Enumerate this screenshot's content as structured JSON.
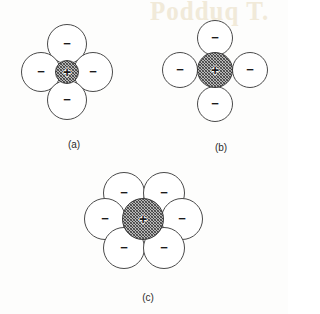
{
  "figure": {
    "background_color": "#fdfdfc",
    "line_color": "#4a4a4a",
    "cation_fill": "#b9b9b9",
    "anion_fill": "#ffffff",
    "bleed_through_text": "Podduq  T.",
    "cation_symbol": "+",
    "anion_symbol": "−"
  },
  "panels": [
    {
      "id": "a",
      "caption": "(a)",
      "caption_x": 64,
      "caption_y": 139,
      "description": "cation too small for cation-anion contact, anions overlap",
      "coordination_number": 4,
      "cation": {
        "cx": 67,
        "cy": 72,
        "r": 12,
        "symbol": "+"
      },
      "anions": [
        {
          "name": "anion-top",
          "cx": 67,
          "cy": 44,
          "r": 20,
          "symbol": "−"
        },
        {
          "name": "anion-left",
          "cx": 41,
          "cy": 72,
          "r": 20,
          "symbol": "−"
        },
        {
          "name": "anion-right",
          "cx": 93,
          "cy": 72,
          "r": 20,
          "symbol": "−"
        },
        {
          "name": "anion-bottom",
          "cx": 67,
          "cy": 100,
          "r": 20,
          "symbol": "−"
        }
      ]
    },
    {
      "id": "b",
      "caption": "(b)",
      "caption_x": 211,
      "caption_y": 142,
      "description": "stable configuration, cation and anions in mutual contact",
      "coordination_number": 4,
      "cation": {
        "cx": 215,
        "cy": 70,
        "r": 18,
        "symbol": "+"
      },
      "anions": [
        {
          "name": "anion-top",
          "cx": 215,
          "cy": 38,
          "r": 18,
          "symbol": "−"
        },
        {
          "name": "anion-left",
          "cx": 180,
          "cy": 70,
          "r": 18,
          "symbol": "−"
        },
        {
          "name": "anion-right",
          "cx": 250,
          "cy": 70,
          "r": 18,
          "symbol": "−"
        },
        {
          "name": "anion-bottom",
          "cx": 215,
          "cy": 104,
          "r": 18,
          "symbol": "−"
        }
      ]
    },
    {
      "id": "c",
      "caption": "(c)",
      "caption_x": 138,
      "caption_y": 292,
      "description": "cation too large, anions no longer in contact, hexagonal coordination",
      "coordination_number": 6,
      "cation": {
        "cx": 143,
        "cy": 219,
        "r": 21,
        "symbol": "+"
      },
      "anions": [
        {
          "name": "anion-top-left",
          "cx": 124,
          "cy": 193,
          "r": 21,
          "symbol": "−"
        },
        {
          "name": "anion-top-right",
          "cx": 164,
          "cy": 193,
          "r": 21,
          "symbol": "−"
        },
        {
          "name": "anion-middle-left",
          "cx": 105,
          "cy": 219,
          "r": 21,
          "symbol": "−"
        },
        {
          "name": "anion-middle-right",
          "cx": 182,
          "cy": 219,
          "r": 21,
          "symbol": "−"
        },
        {
          "name": "anion-bottom-left",
          "cx": 124,
          "cy": 248,
          "r": 21,
          "symbol": "−"
        },
        {
          "name": "anion-bottom-right",
          "cx": 164,
          "cy": 248,
          "r": 21,
          "symbol": "−"
        }
      ]
    }
  ]
}
